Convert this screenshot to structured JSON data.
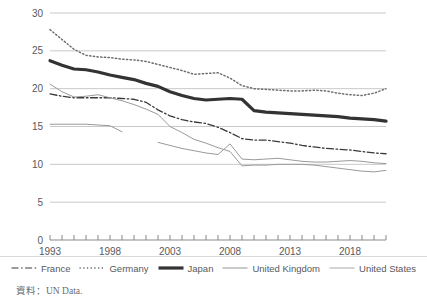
{
  "axes": {
    "y_ticks": [
      "0",
      "5",
      "10",
      "15",
      "20",
      "25",
      "30"
    ],
    "y_values": [
      0,
      5,
      10,
      15,
      20,
      25,
      30
    ],
    "x_ticks": [
      "1993",
      "1998",
      "2003",
      "2008",
      "2013",
      "2018"
    ],
    "x_tick_values": [
      1993,
      1998,
      2003,
      2008,
      2013,
      2018
    ],
    "xlim": [
      1993,
      2021
    ],
    "ylim": [
      0,
      30
    ],
    "grid": "horizontal"
  },
  "legend": {
    "position": "bottom",
    "items": [
      {
        "label": "France",
        "style": "dash-dot",
        "color": "#3a3a3a",
        "width": 1.2
      },
      {
        "label": "Germany",
        "style": "dotted",
        "color": "#6e6e6e",
        "width": 1.4
      },
      {
        "label": "Japan",
        "style": "solid",
        "color": "#333333",
        "width": 3.2
      },
      {
        "label": "United Kingdom",
        "style": "solid",
        "color": "#949494",
        "width": 1.0
      },
      {
        "label": "United States",
        "style": "solid",
        "color": "#a8a8a8",
        "width": 1.0
      }
    ]
  },
  "source": "資料：UN Data.",
  "colors": {
    "grid": "#c9c9c9",
    "axis": "#8a8a8a",
    "text": "#58595b"
  },
  "chart_data": {
    "type": "line",
    "title": "",
    "xlabel": "",
    "ylabel": "",
    "xlim": [
      1993,
      2021
    ],
    "ylim": [
      0,
      30
    ],
    "grid": true,
    "legend_position": "bottom",
    "x": [
      1993,
      1994,
      1995,
      1996,
      1997,
      1998,
      1999,
      2000,
      2001,
      2002,
      2003,
      2004,
      2005,
      2006,
      2007,
      2008,
      2009,
      2010,
      2011,
      2012,
      2013,
      2014,
      2015,
      2016,
      2017,
      2018,
      2019,
      2020,
      2021
    ],
    "series": [
      {
        "name": "France",
        "style": "dash-dot",
        "values": [
          19.3,
          19.0,
          18.8,
          18.8,
          18.8,
          18.8,
          18.7,
          18.6,
          18.2,
          17.2,
          16.4,
          15.9,
          15.6,
          15.4,
          14.9,
          14.2,
          13.4,
          13.2,
          13.2,
          13.0,
          12.8,
          12.5,
          12.3,
          12.1,
          12.0,
          11.9,
          11.7,
          11.5,
          11.4
        ]
      },
      {
        "name": "Germany",
        "style": "dotted",
        "values": [
          27.8,
          26.5,
          25.2,
          24.4,
          24.2,
          24.1,
          23.9,
          23.8,
          23.6,
          23.2,
          22.8,
          22.4,
          21.9,
          22.0,
          22.1,
          21.4,
          20.4,
          20.0,
          19.9,
          19.8,
          19.7,
          19.7,
          19.8,
          19.7,
          19.4,
          19.2,
          19.1,
          19.4,
          20.0
        ]
      },
      {
        "name": "Japan",
        "style": "solid-thick",
        "values": [
          23.7,
          23.1,
          22.6,
          22.5,
          22.2,
          21.8,
          21.5,
          21.2,
          20.7,
          20.3,
          19.6,
          19.1,
          18.7,
          18.5,
          18.6,
          18.7,
          18.6,
          17.1,
          16.9,
          16.8,
          16.7,
          16.6,
          16.5,
          16.4,
          16.3,
          16.1,
          16.0,
          15.9,
          15.7
        ]
      },
      {
        "name": "United Kingdom",
        "style": "solid-thin",
        "values": [
          null,
          null,
          null,
          null,
          null,
          null,
          null,
          null,
          null,
          12.9,
          12.5,
          12.1,
          11.8,
          11.5,
          11.3,
          12.7,
          10.7,
          10.6,
          10.7,
          10.8,
          10.6,
          10.4,
          10.3,
          10.3,
          10.4,
          10.5,
          10.4,
          10.2,
          10.1
        ]
      },
      {
        "name": "United States",
        "style": "solid-thin",
        "values": [
          15.3,
          15.3,
          15.3,
          15.3,
          15.2,
          15.1,
          14.3,
          null,
          null,
          null,
          null,
          null,
          null,
          null,
          null,
          null,
          null,
          null,
          null,
          null,
          null,
          null,
          null,
          null,
          null,
          null,
          null,
          null,
          null
        ]
      },
      {
        "name": "United Kingdom (early)",
        "style": "solid-thin",
        "values": [
          20.6,
          19.6,
          18.9,
          19.0,
          19.2,
          18.8,
          18.4,
          17.9,
          17.3,
          16.6,
          15.0,
          14.2,
          13.3,
          12.8,
          12.2,
          11.7,
          9.8,
          9.9,
          9.9,
          10.0,
          10.0,
          10.0,
          9.9,
          9.7,
          9.5,
          9.3,
          9.1,
          9.0,
          9.2
        ]
      }
    ]
  }
}
